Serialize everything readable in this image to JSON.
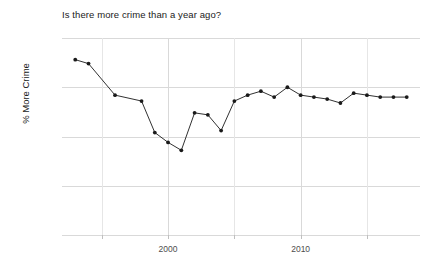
{
  "chart_data": {
    "type": "line",
    "title": "Is there more crime than a year ago?",
    "xlabel": "",
    "ylabel": "% More Crime",
    "xlim": [
      1992,
      2019
    ],
    "ylim": [
      0,
      100
    ],
    "grid": true,
    "legend": false,
    "y_tick_labels": [
      "0%",
      "25%",
      "50%",
      "75%",
      "100%"
    ],
    "y_tick_values": [
      0,
      25,
      50,
      75,
      100
    ],
    "x_tick_labels": [
      "2000",
      "2010"
    ],
    "x_tick_values": [
      2000,
      2010
    ],
    "x_minor_gridlines": [
      1995,
      2000,
      2005,
      2010,
      2015
    ],
    "series": [
      {
        "name": "% More Crime",
        "marker": "circle",
        "color": "#1a1a1a",
        "x": [
          1993,
          1994,
          1996,
          1998,
          1999,
          2000,
          2001,
          2002,
          2003,
          2004,
          2005,
          2006,
          2007,
          2008,
          2009,
          2010,
          2011,
          2012,
          2013,
          2014,
          2015,
          2016,
          2017,
          2018
        ],
        "values": [
          89,
          87,
          71,
          68,
          52,
          47,
          43,
          62,
          61,
          53,
          68,
          71,
          73,
          70,
          75,
          71,
          70,
          69,
          67,
          72,
          71,
          70,
          70,
          70
        ]
      }
    ]
  }
}
